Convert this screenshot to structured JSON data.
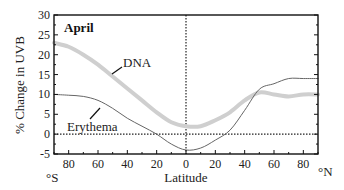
{
  "chart_data": {
    "type": "line",
    "title": "April",
    "xlabel": "Latitude",
    "ylabel": "% Change in UVB",
    "xlim": [
      -90,
      90
    ],
    "ylim": [
      -5,
      30
    ],
    "grid": false,
    "x_ticks": [
      -80,
      -60,
      -40,
      -20,
      0,
      20,
      40,
      60,
      80
    ],
    "x_tick_labels": [
      "80",
      "60",
      "40",
      "20",
      "0",
      "20",
      "40",
      "60",
      "80"
    ],
    "y_ticks": [
      -5,
      0,
      5,
      10,
      15,
      20,
      25,
      30
    ],
    "y_tick_labels": [
      "-5",
      "0",
      "5",
      "10",
      "15",
      "20",
      "25",
      "30"
    ],
    "x_left_unit": "°S",
    "x_right_unit": "°N",
    "reference_lines": [
      {
        "orientation": "horizontal",
        "value": 0,
        "style": "dotted"
      },
      {
        "orientation": "vertical",
        "value": 0,
        "style": "dotted"
      }
    ],
    "series": [
      {
        "name": "DNA",
        "color": "#cfcfcf",
        "width": 4,
        "x": [
          -90,
          -80,
          -70,
          -60,
          -50,
          -40,
          -30,
          -20,
          -10,
          0,
          10,
          20,
          30,
          40,
          50,
          60,
          70,
          80,
          90
        ],
        "y": [
          23,
          22,
          20,
          17.5,
          14.5,
          11.5,
          8.5,
          5.5,
          3,
          2,
          2,
          3.5,
          5.5,
          8.5,
          10.5,
          10,
          9.5,
          10,
          10
        ]
      },
      {
        "name": "Erythema",
        "color": "#666666",
        "width": 1,
        "x": [
          -90,
          -80,
          -70,
          -60,
          -50,
          -40,
          -30,
          -20,
          -10,
          0,
          10,
          20,
          30,
          40,
          50,
          60,
          70,
          80,
          90
        ],
        "y": [
          10,
          9.8,
          9.5,
          8.5,
          6.5,
          4,
          2,
          0,
          -2.5,
          -4,
          -3.5,
          -1.5,
          1,
          6,
          11.3,
          12.7,
          14,
          14,
          14
        ]
      }
    ],
    "annotations": [
      {
        "text": "DNA",
        "x": -48,
        "y": 17.5
      },
      {
        "text": "Erythema",
        "x": -73,
        "y": 5.2
      }
    ]
  }
}
